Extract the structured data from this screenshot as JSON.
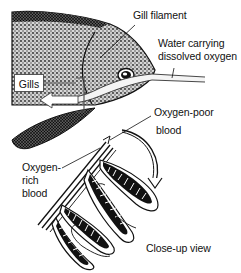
{
  "diagram": {
    "labels": {
      "gill_filament": "Gill filament",
      "water_line1": "Water carrying",
      "water_line2": "dissolved oxygen",
      "gills": "Gills",
      "oxygen_poor_line1": "Oxygen-poor",
      "oxygen_poor_line2": "blood",
      "oxygen_rich_line1": "Oxygen-",
      "oxygen_rich_line2": "rich",
      "oxygen_rich_line3": "blood",
      "closeup": "Close-up view"
    },
    "colors": {
      "ink": "#111111",
      "stipple": "#555555",
      "background": "#ffffff"
    }
  }
}
